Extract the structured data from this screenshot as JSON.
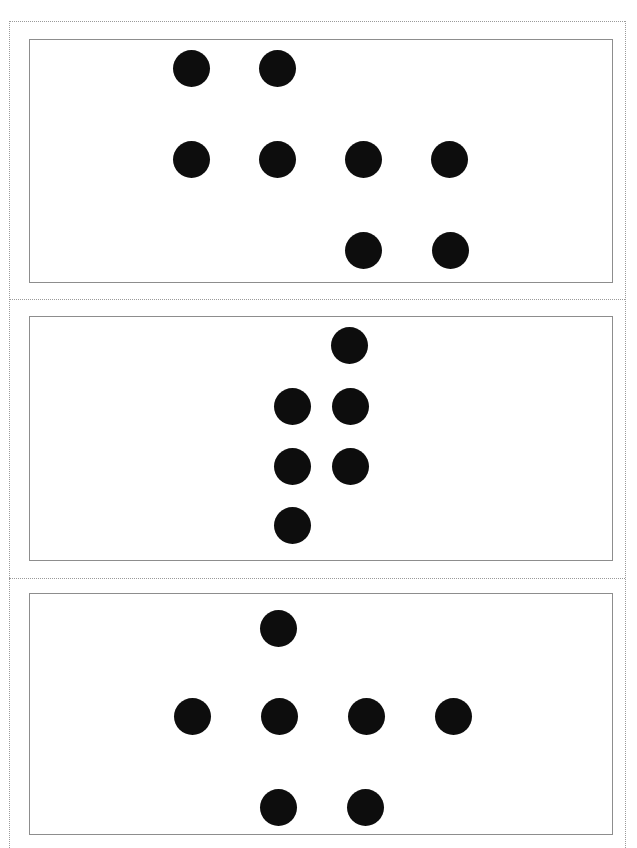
{
  "page": {
    "width": 637,
    "height": 848,
    "background_color": "#ffffff",
    "guide_border_color": "#9a9a9a",
    "guide_border_style": "dotted",
    "panel_border_color": "#8d8d8d",
    "dot_color": "#0d0d0d",
    "dot_diameter": 37
  },
  "guides": {
    "left_x": 9,
    "right_x": 625,
    "top_y": 21,
    "divider_1_y": 299,
    "divider_2_y": 578
  },
  "panels": [
    {
      "id": "panel-1",
      "x": 29,
      "y": 39,
      "width": 584,
      "height": 244,
      "dot_count": 8,
      "dots": [
        {
          "cx": 191,
          "cy": 68
        },
        {
          "cx": 277,
          "cy": 68
        },
        {
          "cx": 191,
          "cy": 159
        },
        {
          "cx": 277,
          "cy": 159
        },
        {
          "cx": 363,
          "cy": 159
        },
        {
          "cx": 449,
          "cy": 159
        },
        {
          "cx": 363,
          "cy": 250
        },
        {
          "cx": 450,
          "cy": 250
        }
      ]
    },
    {
      "id": "panel-2",
      "x": 29,
      "y": 316,
      "width": 584,
      "height": 245,
      "dot_count": 6,
      "dots": [
        {
          "cx": 349,
          "cy": 345
        },
        {
          "cx": 292,
          "cy": 406
        },
        {
          "cx": 350,
          "cy": 406
        },
        {
          "cx": 292,
          "cy": 466
        },
        {
          "cx": 350,
          "cy": 466
        },
        {
          "cx": 292,
          "cy": 525
        }
      ]
    },
    {
      "id": "panel-3",
      "x": 29,
      "y": 593,
      "width": 584,
      "height": 242,
      "dot_count": 7,
      "dots": [
        {
          "cx": 278,
          "cy": 628
        },
        {
          "cx": 192,
          "cy": 716
        },
        {
          "cx": 279,
          "cy": 716
        },
        {
          "cx": 366,
          "cy": 716
        },
        {
          "cx": 453,
          "cy": 716
        },
        {
          "cx": 278,
          "cy": 807
        },
        {
          "cx": 365,
          "cy": 807
        }
      ]
    }
  ]
}
